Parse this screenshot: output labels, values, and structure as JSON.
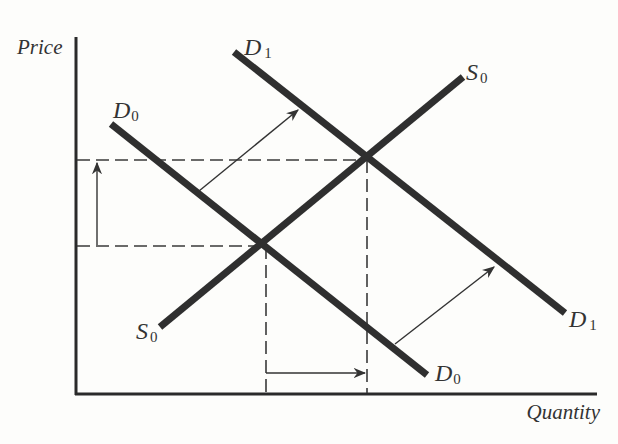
{
  "diagram": {
    "type": "supply-demand",
    "axes": {
      "y_label": "Price",
      "x_label": "Quantity"
    },
    "curves": [
      {
        "id": "D0",
        "letter": "D",
        "subscript": "0",
        "kind": "demand",
        "from": [
          111,
          124
        ],
        "to": [
          427,
          375
        ]
      },
      {
        "id": "D1",
        "letter": "D",
        "subscript": "1",
        "kind": "demand",
        "from": [
          234,
          52
        ],
        "to": [
          565,
          313
        ]
      },
      {
        "id": "S0",
        "letter": "S",
        "subscript": "0",
        "kind": "supply",
        "from": [
          160,
          327
        ],
        "to": [
          463,
          77
        ]
      }
    ],
    "labels": {
      "D0_top": {
        "letter": "D",
        "sub": "0"
      },
      "D0_bottom": {
        "letter": "D",
        "sub": "0"
      },
      "D1_top": {
        "letter": "D",
        "sub": "1"
      },
      "D1_bottom": {
        "letter": "D",
        "sub": "1"
      },
      "S0_top": {
        "letter": "S",
        "sub": "0"
      },
      "S0_bottom": {
        "letter": "S",
        "sub": "0"
      }
    },
    "equilibria": [
      {
        "id": "E0",
        "on": [
          "D0",
          "S0"
        ],
        "price_level": "P0",
        "quantity_level": "Q0"
      },
      {
        "id": "E1",
        "on": [
          "D1",
          "S0"
        ],
        "price_level": "P1",
        "quantity_level": "Q1"
      }
    ],
    "annotations": [
      {
        "kind": "shift-arrow",
        "description": "Demand shifts right from D0 to D1 (upper arrow)"
      },
      {
        "kind": "shift-arrow",
        "description": "Demand shifts right from D0 to D1 (lower arrow)"
      },
      {
        "kind": "price-increase-arrow",
        "description": "Price rises from P0 to P1"
      },
      {
        "kind": "quantity-increase-arrow",
        "description": "Quantity rises from Q0 to Q1"
      }
    ]
  }
}
